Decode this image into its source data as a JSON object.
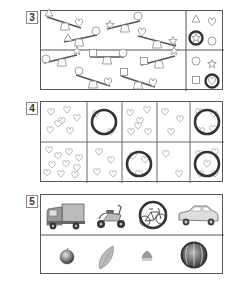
{
  "questions": [
    {
      "number": "3",
      "type": "seesaw-weight-comparison",
      "rows": [
        {
          "seesaws": [
            {
              "heavy": "heart",
              "light": "triangle"
            },
            {
              "heavy": "star",
              "light": "circle"
            },
            {
              "heavy": "circle",
              "light": "triangle"
            },
            {
              "heavy": "heart",
              "light": "star"
            }
          ],
          "options": [
            "triangle",
            "heart",
            "star",
            "circle"
          ],
          "answer_circled": "star"
        },
        {
          "seesaws": [
            {
              "heavy": "circle",
              "light": "star"
            },
            {
              "heavy": "square",
              "light": "circle"
            },
            {
              "heavy": "square",
              "light": "star"
            },
            {
              "heavy": "circle",
              "light": "heart"
            },
            {
              "heavy": "square",
              "light": "heart"
            }
          ],
          "options": [
            "circle",
            "star",
            "square",
            "heart"
          ],
          "answer_circled": "heart"
        }
      ]
    },
    {
      "number": "4",
      "type": "heart-counting",
      "rows": [
        {
          "heart_counts": [
            7,
            2,
            6,
            3,
            4
          ],
          "circled": [
            false,
            true,
            false,
            false,
            true
          ]
        },
        {
          "heart_counts": [
            10,
            4,
            3,
            2,
            4
          ],
          "circled": [
            false,
            false,
            true,
            false,
            true
          ]
        }
      ]
    },
    {
      "number": "5",
      "type": "odd-one-out",
      "rows": [
        {
          "items": [
            "truck",
            "scooter",
            "bicycle",
            "car"
          ],
          "circled": "bicycle"
        },
        {
          "items": [
            "apple",
            "leaf",
            "chestnut",
            "watermelon"
          ],
          "circled": "watermelon"
        }
      ]
    }
  ],
  "colors": {
    "ink": "#555555",
    "answer_ring": "#333333",
    "shape_stroke": "#888888"
  }
}
